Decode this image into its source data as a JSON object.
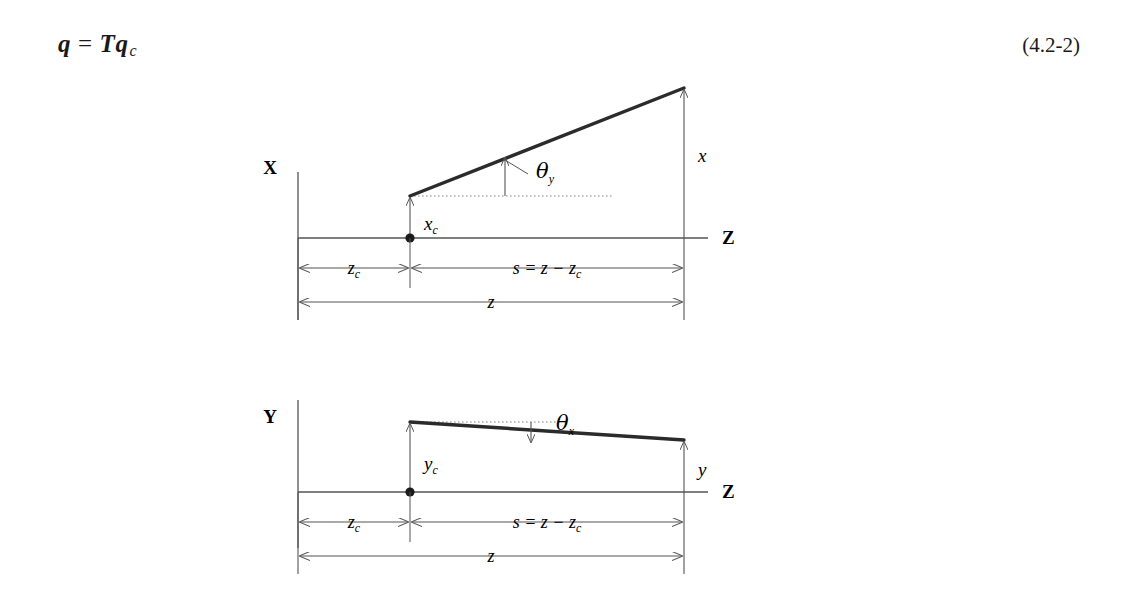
{
  "equation": {
    "lhs": "q",
    "relation": "=",
    "rhs_matrix": "T",
    "rhs_vector": "q",
    "rhs_subscript": "c",
    "number": "(4.2-2)"
  },
  "figure": {
    "upper": {
      "plane_label": "X",
      "axis_label_z": "Z",
      "ray_height_label": "x",
      "offset_label": "x",
      "offset_label_sub": "c",
      "angle_label": "θ",
      "angle_label_sub": "y",
      "dim_near": "z",
      "dim_near_sub": "c",
      "dim_mid_expr": "s  =  z − z",
      "dim_mid_sub": "c",
      "dim_total": "z"
    },
    "lower": {
      "plane_label": "Y",
      "axis_label_z": "Z",
      "ray_height_label": "y",
      "offset_label": "y",
      "offset_label_sub": "c",
      "angle_label": "θ",
      "angle_label_sub": "x",
      "dim_near": "z",
      "dim_near_sub": "c",
      "dim_mid_expr": "s  =  z − z",
      "dim_mid_sub": "c",
      "dim_total": "z"
    }
  },
  "colors": {
    "ink": "#1a1a1a",
    "line": "#555555",
    "ray": "#2b2b2b",
    "dotted": "#8a8a8a",
    "background": "#ffffff"
  }
}
